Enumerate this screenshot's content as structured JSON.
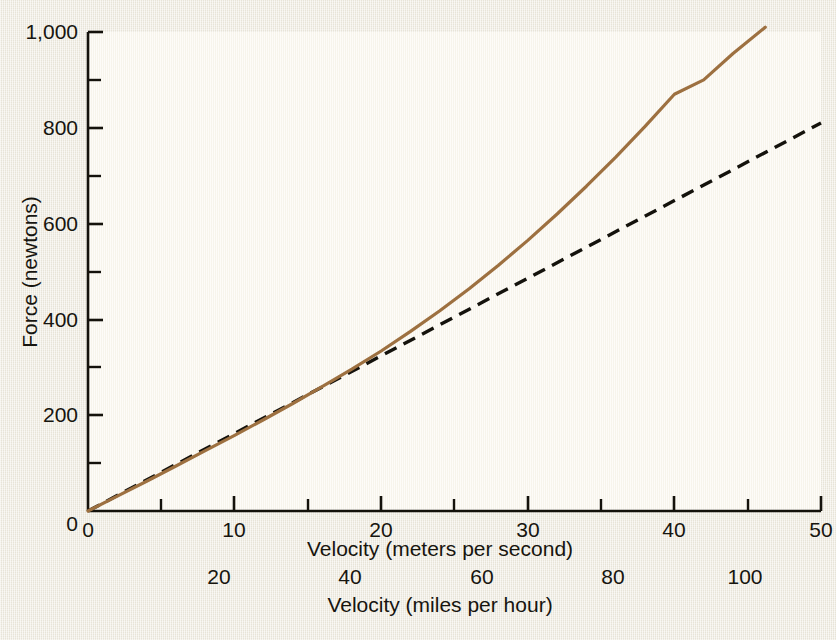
{
  "figure": {
    "background_color": "#ece8dc",
    "plot_background_color": "#faf7ee"
  },
  "chart_data": {
    "type": "line",
    "title": "",
    "xlabel": "Velocity (meters per second)",
    "xlabel_secondary": "Velocity (miles per hour)",
    "ylabel": "Force (newtons)",
    "xlim": [
      0,
      50
    ],
    "ylim": [
      0,
      1000
    ],
    "xlim_secondary": [
      0,
      111.85
    ],
    "grid": false,
    "legend": "none",
    "x_ticks": [
      0,
      10,
      20,
      30,
      40,
      50
    ],
    "x_tick_labels": [
      "0",
      "10",
      "20",
      "30",
      "40",
      "50"
    ],
    "x_minor_ticks": [
      5,
      15,
      25,
      35,
      45
    ],
    "x_ticks_secondary": [
      20,
      40,
      60,
      80,
      100
    ],
    "x_tick_labels_secondary": [
      "20",
      "40",
      "60",
      "80",
      "100"
    ],
    "y_ticks": [
      0,
      200,
      400,
      600,
      800,
      1000
    ],
    "y_tick_labels": [
      "0",
      "200",
      "400",
      "600",
      "800",
      "1,000"
    ],
    "y_minor_ticks": [
      100,
      300,
      500,
      700,
      900
    ],
    "series": [
      {
        "name": "total-drag-force",
        "style": "solid",
        "color": "#9d7040",
        "width": 3.2,
        "x": [
          0,
          2,
          4,
          6,
          8,
          10,
          12,
          14,
          16,
          18,
          20,
          22,
          24,
          26,
          28,
          30,
          32,
          34,
          36,
          38,
          40,
          42,
          44,
          46.2
        ],
        "y": [
          0,
          31,
          62,
          94,
          126,
          158,
          191,
          225,
          260,
          296,
          334,
          375,
          418,
          464,
          513,
          565,
          620,
          678,
          739,
          803,
          870,
          900,
          955,
          1010
        ]
      },
      {
        "name": "linear-drag-force",
        "style": "dashed",
        "color": "#14120c",
        "width": 3.4,
        "x": [
          0,
          10,
          20,
          30,
          40,
          50
        ],
        "y": [
          0,
          162,
          324,
          486,
          648,
          810
        ]
      }
    ]
  },
  "axes": {
    "y_tick_labels": [
      "1,000",
      "800",
      "600",
      "400",
      "200",
      "0"
    ],
    "x_tick_labels": [
      "0",
      "10",
      "20",
      "30",
      "40",
      "50"
    ],
    "x_tick_labels_secondary": [
      "20",
      "40",
      "60",
      "80",
      "100"
    ],
    "x_title": "Velocity (meters per second)",
    "x_title_secondary": "Velocity (miles per hour)",
    "y_title": "Force (newtons)"
  }
}
